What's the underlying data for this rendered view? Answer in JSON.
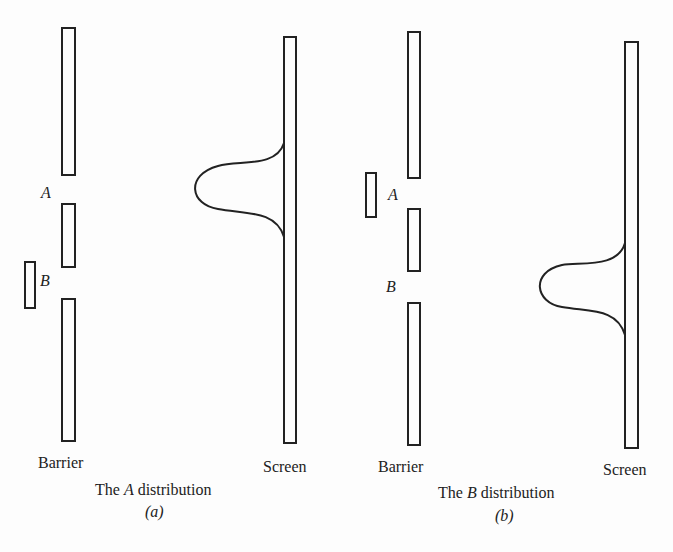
{
  "panels": [
    {
      "id": "a",
      "barrier_label": "Barrier",
      "screen_label": "Screen",
      "slit_upper_label": "A",
      "slit_lower_label": "B",
      "blocked_slit": "B",
      "caption_prefix": "The ",
      "caption_slit": "A",
      "caption_suffix": " distribution",
      "sublabel": "(a)"
    },
    {
      "id": "b",
      "barrier_label": "Barrier",
      "screen_label": "Screen",
      "slit_upper_label": "A",
      "slit_lower_label": "B",
      "blocked_slit": "A",
      "caption_prefix": "The ",
      "caption_slit": "B",
      "caption_suffix": " distribution",
      "sublabel": "(b)"
    }
  ]
}
